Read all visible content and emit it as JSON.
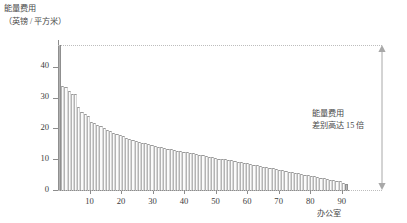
{
  "chart_data": {
    "type": "bar",
    "title": "",
    "ylabel_lines": [
      "能量费用",
      "（英镑 / 平方米）"
    ],
    "xlabel": "办公室",
    "ylim": [
      0,
      48
    ],
    "yticks": [
      0,
      10,
      20,
      30,
      40
    ],
    "xticks": [
      10,
      20,
      30,
      40,
      50,
      60,
      70,
      80,
      90
    ],
    "xlim": [
      0,
      92
    ],
    "grid": false,
    "legend": null,
    "annotation_lines": [
      "能量费用",
      "差别高达 15 倍"
    ],
    "bar_color": "#fbfbfb",
    "bar_edge_color": "#9a9a9a",
    "highlight_color": "#b0b0b0",
    "categories": [
      1,
      2,
      3,
      4,
      5,
      6,
      7,
      8,
      9,
      10,
      11,
      12,
      13,
      14,
      15,
      16,
      17,
      18,
      19,
      20,
      21,
      22,
      23,
      24,
      25,
      26,
      27,
      28,
      29,
      30,
      31,
      32,
      33,
      34,
      35,
      36,
      37,
      38,
      39,
      40,
      41,
      42,
      43,
      44,
      45,
      46,
      47,
      48,
      49,
      50,
      51,
      52,
      53,
      54,
      55,
      56,
      57,
      58,
      59,
      60,
      61,
      62,
      63,
      64,
      65,
      66,
      67,
      68,
      69,
      70,
      71,
      72,
      73,
      74,
      75,
      76,
      77,
      78,
      79,
      80,
      81,
      82,
      83,
      84,
      85,
      86,
      87,
      88,
      89,
      90,
      91
    ],
    "values": [
      47.0,
      33.8,
      33.4,
      32.0,
      31.2,
      31.0,
      27.0,
      25.4,
      24.6,
      24.0,
      22.0,
      21.6,
      21.2,
      20.6,
      20.2,
      19.4,
      19.0,
      18.6,
      18.2,
      17.8,
      17.4,
      17.0,
      16.6,
      16.3,
      16.0,
      15.7,
      15.4,
      15.1,
      14.8,
      14.5,
      14.2,
      14.0,
      13.8,
      13.6,
      13.4,
      13.2,
      13.0,
      12.8,
      12.6,
      12.4,
      12.2,
      12.0,
      11.9,
      11.7,
      11.5,
      11.2,
      11.0,
      10.8,
      10.6,
      10.4,
      10.2,
      10.0,
      9.9,
      9.8,
      9.7,
      9.5,
      9.2,
      9.0,
      8.8,
      8.6,
      8.4,
      8.2,
      8.0,
      7.8,
      7.6,
      7.4,
      7.2,
      7.0,
      6.8,
      6.6,
      6.4,
      6.2,
      6.0,
      5.8,
      5.6,
      5.4,
      5.2,
      5.0,
      4.8,
      4.6,
      4.4,
      4.2,
      4.0,
      3.8,
      3.6,
      3.4,
      3.2,
      3.0,
      2.8,
      2.4,
      2.0
    ]
  }
}
